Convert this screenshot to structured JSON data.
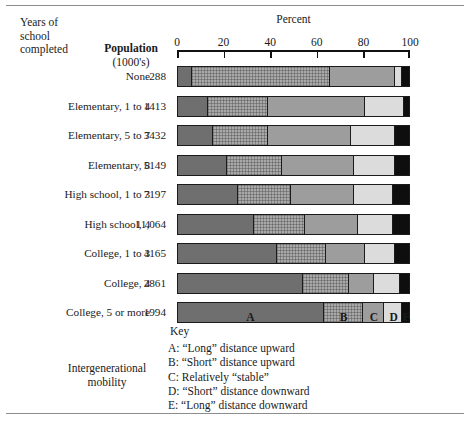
{
  "figure": {
    "header": {
      "years_label_lines": [
        "Years of",
        "school",
        "completed"
      ],
      "population_label": "Population",
      "population_sub": "(1000's)",
      "percent_axis_title": "Percent"
    },
    "axis": {
      "ticks": [
        0,
        20,
        40,
        60,
        80,
        100
      ],
      "tick_labels": [
        "0",
        "20",
        "40",
        "60",
        "80",
        "100"
      ],
      "min": 0,
      "max": 100
    },
    "segment_letters": [
      "A",
      "B",
      "C",
      "D",
      "E"
    ],
    "key": {
      "title": "Key",
      "items": [
        "A: “Long” distance upward",
        "B: “Short” distance upward",
        "C: Relatively “stable”",
        "D: “Short” distance downward",
        "E: “Long” distance downward"
      ],
      "group_label_lines": [
        "Intergenerational",
        "mobility"
      ]
    },
    "colors": {
      "A": "#6f6f6f",
      "B": "#a9a9a9",
      "C": "#9d9d9d",
      "D": "#dcdcdc",
      "E": "#0e0e0e",
      "outline": "#1b1b1b",
      "rule": "#8d8d8d",
      "background": "#ffffff"
    }
  },
  "chart_data": {
    "type": "bar",
    "orientation": "horizontal",
    "stacked": true,
    "title": "",
    "xlabel": "Percent",
    "ylabel": "Years of school completed",
    "xlim": [
      0,
      100
    ],
    "grid": false,
    "legend_position": "bottom",
    "categories": [
      "None",
      "Elementary, 1 to 4",
      "Elementary, 5 to 7",
      "Elementary, 8",
      "High school, 1 to 3",
      "High school, 4",
      "College, 1 to 3",
      "College, 4",
      "College, 5 or more"
    ],
    "population_thousands": [
      "288",
      "1413",
      "3432",
      "5149",
      "7197",
      "11,064",
      "4165",
      "2861",
      "1994"
    ],
    "series": [
      {
        "name": "A",
        "label": "“Long” distance upward",
        "values": [
          6,
          13,
          15,
          21,
          26,
          33,
          43,
          54,
          63
        ]
      },
      {
        "name": "B",
        "label": "“Short” distance upward",
        "values": [
          60,
          26,
          24,
          24,
          23,
          22,
          21,
          20,
          17
        ]
      },
      {
        "name": "C",
        "label": "Relatively “stable”",
        "values": [
          28,
          42,
          36,
          31,
          27,
          23,
          17,
          11,
          9
        ]
      },
      {
        "name": "D",
        "label": "“Short” distance downward",
        "values": [
          3,
          17,
          19,
          18,
          17,
          15,
          13,
          11,
          8
        ]
      },
      {
        "name": "E",
        "label": "“Long” distance downward",
        "values": [
          3,
          2,
          6,
          6,
          7,
          7,
          6,
          4,
          3
        ]
      }
    ],
    "rows": [
      {
        "category": "None",
        "population": "288",
        "segments": [
          6,
          60,
          28,
          3,
          3
        ]
      },
      {
        "category": "Elementary, 1 to 4",
        "population": "1413",
        "segments": [
          13,
          26,
          42,
          17,
          2
        ]
      },
      {
        "category": "Elementary, 5 to 7",
        "population": "3432",
        "segments": [
          15,
          24,
          36,
          19,
          6
        ]
      },
      {
        "category": "Elementary, 8",
        "population": "5149",
        "segments": [
          21,
          24,
          31,
          18,
          6
        ]
      },
      {
        "category": "High school, 1 to 3",
        "population": "7197",
        "segments": [
          26,
          23,
          27,
          17,
          7
        ]
      },
      {
        "category": "High school, 4",
        "population": "11,064",
        "segments": [
          33,
          22,
          23,
          15,
          7
        ]
      },
      {
        "category": "College, 1 to 3",
        "population": "4165",
        "segments": [
          43,
          21,
          17,
          13,
          6
        ]
      },
      {
        "category": "College, 4",
        "population": "2861",
        "segments": [
          54,
          20,
          11,
          11,
          4
        ]
      },
      {
        "category": "College, 5 or more",
        "population": "1994",
        "segments": [
          63,
          17,
          9,
          8,
          3
        ]
      }
    ]
  }
}
